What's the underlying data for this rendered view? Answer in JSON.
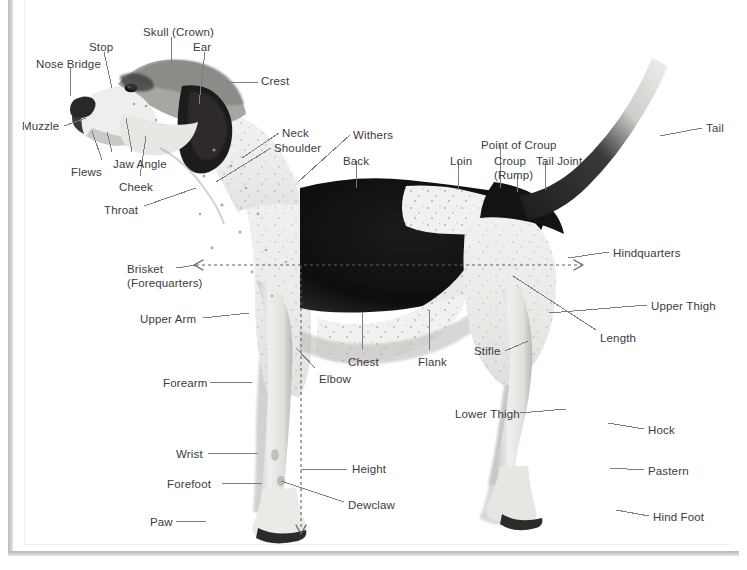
{
  "diagram": {
    "background_color": "#ffffff",
    "label_color": "#3b3b3d",
    "leader_color": "#7b7d80",
    "frame_color": "#c1c4c5",
    "labels": [
      {
        "id": "nose-bridge",
        "text": "Nose Bridge",
        "x": 36,
        "y": 58,
        "align": "left"
      },
      {
        "id": "stop",
        "text": "Stop",
        "x": 89,
        "y": 41,
        "align": "left"
      },
      {
        "id": "skull-crown",
        "text": "Skull (Crown)",
        "x": 143,
        "y": 26,
        "align": "left"
      },
      {
        "id": "ear",
        "text": "Ear",
        "x": 193,
        "y": 41,
        "align": "left"
      },
      {
        "id": "crest",
        "text": "Crest",
        "x": 261,
        "y": 75,
        "align": "left"
      },
      {
        "id": "muzzle",
        "text": "Muzzle",
        "x": 22,
        "y": 120,
        "align": "left"
      },
      {
        "id": "flews",
        "text": "Flews",
        "x": 71,
        "y": 166,
        "align": "left"
      },
      {
        "id": "jaw-angle",
        "text": "Jaw Angle",
        "x": 113,
        "y": 158,
        "align": "left"
      },
      {
        "id": "cheek",
        "text": "Cheek",
        "x": 119,
        "y": 181,
        "align": "left"
      },
      {
        "id": "throat",
        "text": "Throat",
        "x": 104,
        "y": 204,
        "align": "left"
      },
      {
        "id": "neck",
        "text": "Neck",
        "x": 282,
        "y": 127,
        "align": "left"
      },
      {
        "id": "shoulder",
        "text": "Shoulder",
        "x": 274,
        "y": 142,
        "align": "left"
      },
      {
        "id": "withers",
        "text": "Withers",
        "x": 353,
        "y": 129,
        "align": "left"
      },
      {
        "id": "back",
        "text": "Back",
        "x": 343,
        "y": 155,
        "align": "left"
      },
      {
        "id": "loin",
        "text": "Loin",
        "x": 450,
        "y": 155,
        "align": "left"
      },
      {
        "id": "point-of-croup",
        "text": "Point of Croup",
        "x": 481,
        "y": 139,
        "align": "left"
      },
      {
        "id": "croup-rump",
        "text": "Croup\n(Rump)",
        "x": 494,
        "y": 155,
        "align": "left"
      },
      {
        "id": "tail-joint",
        "text": "Tail Joint",
        "x": 536,
        "y": 155,
        "align": "left"
      },
      {
        "id": "tail",
        "text": "Tail",
        "x": 706,
        "y": 122,
        "align": "left"
      },
      {
        "id": "hindquarters",
        "text": "Hindquarters",
        "x": 613,
        "y": 247,
        "align": "left"
      },
      {
        "id": "upper-thigh",
        "text": "Upper Thigh",
        "x": 651,
        "y": 300,
        "align": "left"
      },
      {
        "id": "length",
        "text": "Length",
        "x": 600,
        "y": 332,
        "align": "left"
      },
      {
        "id": "brisket",
        "text": "Brisket\n(Forequarters)",
        "x": 127,
        "y": 263,
        "align": "left"
      },
      {
        "id": "upper-arm",
        "text": "Upper Arm",
        "x": 140,
        "y": 313,
        "align": "left"
      },
      {
        "id": "forearm",
        "text": "Forearm",
        "x": 163,
        "y": 377,
        "align": "left"
      },
      {
        "id": "wrist",
        "text": "Wrist",
        "x": 176,
        "y": 448,
        "align": "left"
      },
      {
        "id": "forefoot",
        "text": "Forefoot",
        "x": 167,
        "y": 478,
        "align": "left"
      },
      {
        "id": "paw",
        "text": "Paw",
        "x": 150,
        "y": 516,
        "align": "left"
      },
      {
        "id": "chest",
        "text": "Chest",
        "x": 348,
        "y": 356,
        "align": "left"
      },
      {
        "id": "elbow",
        "text": "Elbow",
        "x": 319,
        "y": 373,
        "align": "left"
      },
      {
        "id": "flank",
        "text": "Flank",
        "x": 418,
        "y": 356,
        "align": "left"
      },
      {
        "id": "stifle",
        "text": "Stifle",
        "x": 474,
        "y": 345,
        "align": "left"
      },
      {
        "id": "height",
        "text": "Height",
        "x": 352,
        "y": 463,
        "align": "left"
      },
      {
        "id": "dewclaw",
        "text": "Dewclaw",
        "x": 348,
        "y": 499,
        "align": "left"
      },
      {
        "id": "lower-thigh",
        "text": "Lower Thigh",
        "x": 455,
        "y": 408,
        "align": "left"
      },
      {
        "id": "hock",
        "text": "Hock",
        "x": 648,
        "y": 424,
        "align": "left"
      },
      {
        "id": "pastern",
        "text": "Pastern",
        "x": 648,
        "y": 465,
        "align": "left"
      },
      {
        "id": "hind-foot",
        "text": "Hind Foot",
        "x": 653,
        "y": 511,
        "align": "left"
      }
    ],
    "measurements": [
      {
        "id": "length-line",
        "orientation": "horizontal",
        "label": "Length",
        "x1": 196,
        "y1": 265,
        "x2": 581,
        "y2": 265,
        "arrows": "both",
        "style": "dashed"
      },
      {
        "id": "height-line",
        "orientation": "vertical",
        "label": "Height",
        "x1": 301,
        "y1": 265,
        "x2": 301,
        "y2": 534,
        "arrows": "end",
        "style": "dashed"
      }
    ]
  }
}
